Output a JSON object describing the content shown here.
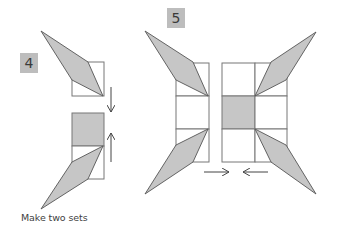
{
  "steps": [
    {
      "number": "4",
      "label_box": {
        "x": 20,
        "y": 53,
        "w": 18,
        "h": 20
      }
    },
    {
      "number": "5",
      "label_box": {
        "x": 167,
        "y": 8,
        "w": 18,
        "h": 20
      }
    }
  ],
  "caption": "Make two sets",
  "colors": {
    "shade": "#c6c6c6",
    "stroke": "#555555",
    "square_stroke": "#777777",
    "label_bg": "#bdbdbd",
    "text": "#3f3f3f"
  }
}
